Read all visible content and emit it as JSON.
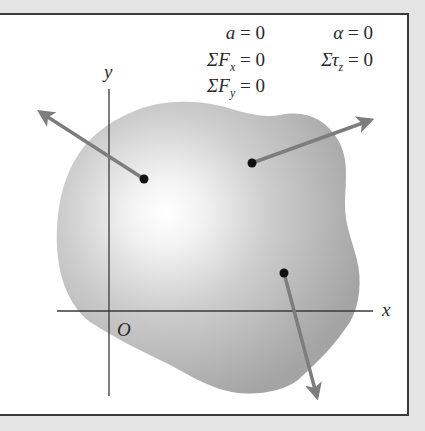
{
  "diagram": {
    "equations": {
      "col1": [
        {
          "lhs": "a",
          "rhs": "= 0"
        },
        {
          "lhs": "ΣF",
          "sub": "x",
          "rhs": "= 0"
        },
        {
          "lhs": "ΣF",
          "sub": "y",
          "rhs": "= 0"
        }
      ],
      "col2": [
        {
          "lhs": "α",
          "rhs": "= 0"
        },
        {
          "lhs": "Στ",
          "sub": "z",
          "rhs": "= 0"
        }
      ]
    },
    "axes": {
      "x_label": "x",
      "y_label": "y",
      "origin_label": "O"
    },
    "forces": [
      {
        "name": "force-1",
        "from": [
          144,
          179
        ],
        "to": [
          36,
          109
        ]
      },
      {
        "name": "force-2",
        "from": [
          252,
          163
        ],
        "to": [
          375,
          118
        ]
      },
      {
        "name": "force-3",
        "from": [
          284,
          273
        ],
        "to": [
          318,
          401
        ]
      }
    ],
    "colors": {
      "background": "#e4e4e4",
      "frame_border": "#3a3a3a",
      "body_fill_dark": "#a6a6a6",
      "body_fill_light": "#ffffff",
      "arrow": "#7d7d7d",
      "axis": "#3a3a3a",
      "point": "#111111"
    }
  }
}
